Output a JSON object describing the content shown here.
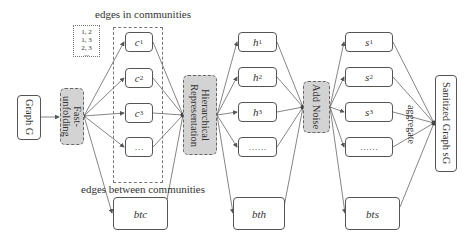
{
  "diagram": {
    "input": "Graph G",
    "fast_unfolding": "Fast-unfolding",
    "edges_in_communities_label": "edges in communities",
    "edges_between_communities_label": "edges between communities",
    "edge_list": [
      "1, 2",
      "1, 3",
      "2, 3",
      "..."
    ],
    "communities": [
      {
        "base": "c",
        "sub": "1"
      },
      {
        "base": "c",
        "sub": "2"
      },
      {
        "base": "c",
        "sub": "3"
      },
      {
        "base": "…",
        "sub": ""
      }
    ],
    "btc": "btc",
    "hierarchical": "Hierarchical Representation",
    "hierarchical_line1": "Hierarchical",
    "hierarchical_line2": "Representation",
    "h_nodes": [
      {
        "base": "h",
        "sub": "1"
      },
      {
        "base": "h",
        "sub": "2"
      },
      {
        "base": "h",
        "sub": "3"
      },
      {
        "base": "……",
        "sub": ""
      }
    ],
    "bth": "bth",
    "add_noise": "Add Noise",
    "s_nodes": [
      {
        "base": "s",
        "sub": "1"
      },
      {
        "base": "s",
        "sub": "2"
      },
      {
        "base": "s",
        "sub": "3"
      },
      {
        "base": "……",
        "sub": ""
      }
    ],
    "bts": "bts",
    "aggregate": "aggregate",
    "output": "Sanitized Graph sG"
  }
}
